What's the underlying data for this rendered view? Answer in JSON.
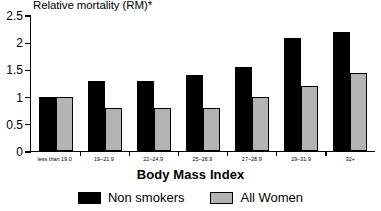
{
  "chart_data": {
    "type": "bar",
    "title": "",
    "ylabel": "Relative mortality (RM)*",
    "xlabel": "Body Mass Index",
    "categories": [
      "less than 19.0",
      "19–21.9",
      "22–24.9",
      "25–26.9",
      "27–28.9",
      "29–31.9",
      "32+"
    ],
    "series": [
      {
        "name": "Non smokers",
        "color": "#000000",
        "values": [
          1.0,
          1.3,
          1.3,
          1.4,
          1.55,
          2.1,
          2.2
        ]
      },
      {
        "name": "All Women",
        "color": "#b3b3b3",
        "values": [
          1.0,
          0.8,
          0.8,
          0.8,
          1.0,
          1.2,
          1.45
        ]
      }
    ],
    "ylim": [
      0,
      2.5
    ],
    "yticks": [
      0,
      0.5,
      1,
      1.5,
      2,
      2.5
    ],
    "ytick_labels": [
      "0",
      "0.5",
      "1",
      "1.5",
      "2",
      "2.5"
    ],
    "grid": false,
    "legend_position": "bottom"
  },
  "legend": {
    "items": [
      {
        "label": "Non smokers",
        "swatch": "black-square-swatch"
      },
      {
        "label": "All Women",
        "swatch": "gray-square-swatch"
      }
    ]
  }
}
